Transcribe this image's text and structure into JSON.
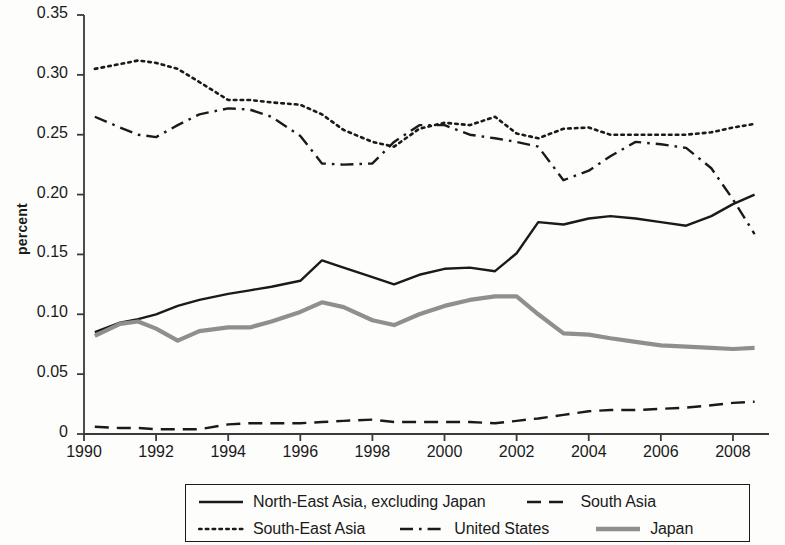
{
  "chart_data": {
    "type": "line",
    "title": "",
    "xlabel": "",
    "ylabel": "percent",
    "xlim": [
      1990,
      2009
    ],
    "ylim": [
      0,
      0.35
    ],
    "xticks": [
      1990,
      1992,
      1994,
      1996,
      1998,
      2000,
      2002,
      2004,
      2006,
      2008
    ],
    "xticklabels": [
      "1990",
      "1992",
      "1994",
      "1996",
      "1998",
      "2000",
      "2002",
      "2004",
      "2006",
      "2008"
    ],
    "yticks": [
      0,
      0.05,
      0.1,
      0.15,
      0.2,
      0.25,
      0.3,
      0.35
    ],
    "yticklabels": [
      "0",
      "0.05",
      "0.10",
      "0.15",
      "0.20",
      "0.25",
      "0.30",
      "0.35"
    ],
    "grid": false,
    "legend_position": "below-axes",
    "x": [
      1990.3,
      1991.0,
      1991.5,
      1992.0,
      1992.6,
      1993.2,
      1994.0,
      1994.6,
      1995.2,
      1996.0,
      1996.6,
      1997.2,
      1998.0,
      1998.6,
      1999.3,
      2000.0,
      2000.7,
      2001.4,
      2002.0,
      2002.6,
      2003.3,
      2004.0,
      2004.6,
      2005.3,
      2006.0,
      2006.7,
      2007.4,
      2008.0,
      2008.6
    ],
    "series": [
      {
        "name": "North-East Asia, excluding Japan",
        "style": "solid",
        "color": "#1a1a1a",
        "width": 2.4,
        "values": [
          0.085,
          0.093,
          0.096,
          0.1,
          0.107,
          0.112,
          0.117,
          0.12,
          0.123,
          0.128,
          0.145,
          0.139,
          0.131,
          0.125,
          0.133,
          0.138,
          0.139,
          0.136,
          0.151,
          0.177,
          0.175,
          0.18,
          0.182,
          0.18,
          0.177,
          0.174,
          0.182,
          0.192,
          0.2
        ]
      },
      {
        "name": "South Asia",
        "style": "dashed",
        "color": "#1a1a1a",
        "width": 2.4,
        "values": [
          0.006,
          0.005,
          0.005,
          0.004,
          0.004,
          0.004,
          0.008,
          0.009,
          0.009,
          0.009,
          0.01,
          0.011,
          0.012,
          0.01,
          0.01,
          0.01,
          0.01,
          0.009,
          0.011,
          0.013,
          0.016,
          0.019,
          0.02,
          0.02,
          0.021,
          0.022,
          0.024,
          0.026,
          0.027
        ]
      },
      {
        "name": "South-East Asia",
        "style": "dotted",
        "color": "#1a1a1a",
        "width": 2.6,
        "values": [
          0.305,
          0.309,
          0.312,
          0.31,
          0.305,
          0.294,
          0.279,
          0.279,
          0.277,
          0.275,
          0.267,
          0.254,
          0.244,
          0.24,
          0.255,
          0.26,
          0.258,
          0.265,
          0.251,
          0.247,
          0.255,
          0.256,
          0.25,
          0.25,
          0.25,
          0.25,
          0.252,
          0.256,
          0.259
        ]
      },
      {
        "name": "United States",
        "style": "dashdot",
        "color": "#1a1a1a",
        "width": 2.4,
        "values": [
          0.265,
          0.256,
          0.25,
          0.248,
          0.258,
          0.267,
          0.272,
          0.271,
          0.265,
          0.249,
          0.226,
          0.225,
          0.226,
          0.244,
          0.258,
          0.258,
          0.25,
          0.247,
          0.244,
          0.24,
          0.212,
          0.22,
          0.232,
          0.244,
          0.242,
          0.239,
          0.222,
          0.196,
          0.167
        ]
      },
      {
        "name": "Japan",
        "style": "solid",
        "color": "#8f8f8f",
        "width": 4.2,
        "values": [
          0.082,
          0.092,
          0.094,
          0.088,
          0.078,
          0.086,
          0.089,
          0.089,
          0.094,
          0.102,
          0.11,
          0.106,
          0.095,
          0.091,
          0.1,
          0.107,
          0.112,
          0.115,
          0.115,
          0.1,
          0.084,
          0.083,
          0.08,
          0.077,
          0.074,
          0.073,
          0.072,
          0.071,
          0.072
        ]
      }
    ]
  },
  "axis": {
    "y_label": "percent"
  },
  "legend": {
    "rows": [
      [
        {
          "label": "North-East Asia, excluding Japan",
          "style": "solid",
          "color": "#1a1a1a"
        },
        {
          "label": "South Asia",
          "style": "dashed",
          "color": "#1a1a1a"
        }
      ],
      [
        {
          "label": "South-East Asia",
          "style": "dotted",
          "color": "#1a1a1a"
        },
        {
          "label": "United States",
          "style": "dashdot",
          "color": "#1a1a1a"
        },
        {
          "label": "Japan",
          "style": "solid-thick",
          "color": "#8f8f8f"
        }
      ]
    ]
  }
}
